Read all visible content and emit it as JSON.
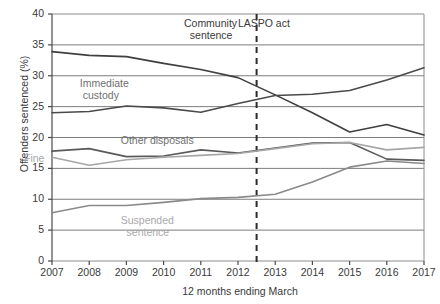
{
  "chart_data": {
    "type": "line",
    "title": "",
    "xlabel": "12 months ending March",
    "ylabel": "Offenders sentenced (%)",
    "categories": [
      "2007",
      "2008",
      "2009",
      "2010",
      "2011",
      "2012",
      "2013",
      "2014",
      "2015",
      "2016",
      "2017"
    ],
    "x": [
      2007,
      2008,
      2009,
      2010,
      2011,
      2012,
      2013,
      2014,
      2015,
      2016,
      2017
    ],
    "xlim": [
      2007,
      2017
    ],
    "ylim": [
      0,
      40
    ],
    "yticks": [
      0,
      5,
      10,
      15,
      20,
      25,
      30,
      35,
      40
    ],
    "ytick_labels": [
      "0",
      "5",
      "10",
      "15",
      "20",
      "25",
      "30",
      "35",
      "40"
    ],
    "grid": true,
    "grid_axis": "y",
    "legend": "inline-annotations",
    "series": [
      {
        "name": "Community sentence",
        "color": "#3f3f3f",
        "values": [
          33.9,
          33.3,
          33.1,
          32.0,
          31.0,
          29.7,
          26.9,
          24.0,
          20.9,
          22.1,
          20.4
        ]
      },
      {
        "name": "Immediate custody",
        "color": "#4a4a4a",
        "values": [
          24.0,
          24.2,
          25.1,
          24.8,
          24.1,
          25.5,
          26.8,
          27.0,
          27.6,
          29.3,
          31.3
        ]
      },
      {
        "name": "Other disposals",
        "color": "#5a5a5a",
        "values": [
          17.8,
          18.2,
          16.9,
          17.0,
          18.0,
          17.5,
          18.3,
          19.1,
          19.2,
          16.5,
          16.3
        ]
      },
      {
        "name": "Fine",
        "color": "#a6a6a6",
        "values": [
          16.8,
          15.5,
          16.4,
          16.8,
          17.1,
          17.4,
          18.2,
          19.0,
          19.2,
          18.0,
          18.4
        ]
      },
      {
        "name": "Suspended sentence",
        "color": "#8a8a8a",
        "values": [
          7.8,
          9.0,
          9.0,
          9.5,
          10.1,
          10.3,
          10.8,
          12.8,
          15.2,
          16.2,
          15.8
        ]
      }
    ],
    "annotations": [
      {
        "id": "community-sentence",
        "text": "Community\n  sentence",
        "x": 2011.3,
        "y": 38.5,
        "color": "#3a3a3a"
      },
      {
        "id": "immediate-custody",
        "text": "Immediate\n custody",
        "x": 2008.5,
        "y": 28.9,
        "color": "#6f6f6f"
      },
      {
        "id": "other-disposals",
        "text": "Other disposals",
        "x": 2009.6,
        "y": 19.6,
        "color": "#6f6f6f"
      },
      {
        "id": "fine",
        "text": "Fine",
        "x": 2007.0,
        "y": 16.6,
        "color": "#a9a9a9"
      },
      {
        "id": "suspended-sentence",
        "text": "Suspended\n  sentence",
        "x": 2009.6,
        "y": 6.6,
        "color": "#a9a9a9"
      },
      {
        "id": "laspo-act",
        "text": "LASPO act",
        "x": 2012.75,
        "y": 38.5,
        "color": "#3a3a3a"
      }
    ],
    "vline": {
      "label": "LASPO act",
      "x": 2012.5,
      "style": "dashed",
      "color": "#2b2b2b"
    }
  },
  "axis": {
    "y_title": "Offenders sentenced (%)",
    "x_title": "12 months ending March"
  }
}
